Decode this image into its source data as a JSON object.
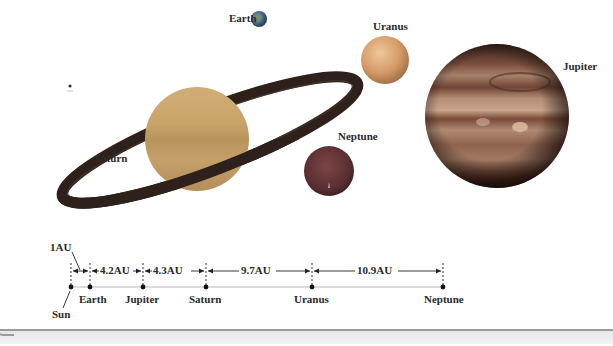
{
  "figure": {
    "type": "solar-system-outer-planets-diagram",
    "planets": [
      {
        "name": "Earth",
        "label": "Earth",
        "color": "#4a6e8c"
      },
      {
        "name": "Uranus",
        "label": "Uranus",
        "color": "#d9a06a"
      },
      {
        "name": "Jupiter",
        "label": "Jupiter",
        "color": "#8a5a45"
      },
      {
        "name": "Saturn",
        "label": "Saturn",
        "color": "#c9a56a",
        "ring_color": "#3a2a22"
      },
      {
        "name": "Neptune",
        "label": "Neptune",
        "color": "#6b3a3a"
      }
    ],
    "scale": {
      "bodies": [
        "Sun",
        "Earth",
        "Jupiter",
        "Saturn",
        "Uranus",
        "Neptune"
      ],
      "gaps": [
        {
          "from": "Sun",
          "to": "Earth",
          "label": "1AU"
        },
        {
          "from": "Earth",
          "to": "Jupiter",
          "label": "4.2AU"
        },
        {
          "from": "Jupiter",
          "to": "Saturn",
          "label": "4.3AU"
        },
        {
          "from": "Saturn",
          "to": "Uranus",
          "label": "9.7AU"
        },
        {
          "from": "Uranus",
          "to": "Neptune",
          "label": "10.9AU"
        }
      ]
    }
  }
}
